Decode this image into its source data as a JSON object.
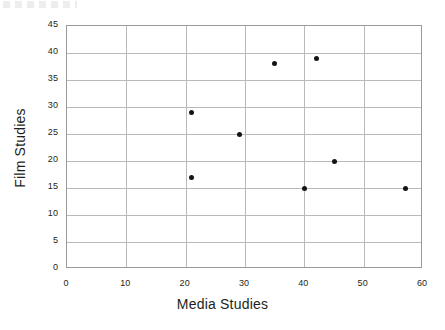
{
  "chart_data": {
    "type": "scatter",
    "title": "",
    "xlabel": "Media Studies",
    "ylabel": "Film Studies",
    "xlim": [
      0,
      60
    ],
    "ylim": [
      0,
      45
    ],
    "xticks": [
      0,
      10,
      20,
      30,
      40,
      50,
      60
    ],
    "yticks": [
      0,
      5,
      10,
      15,
      20,
      25,
      30,
      35,
      40,
      45
    ],
    "grid": true,
    "legend": "none",
    "marker_color": "#141414",
    "grid_color": "#b9b9bd",
    "axis_color": "#9a9a9e",
    "points": [
      {
        "x": 21,
        "y": 29
      },
      {
        "x": 21,
        "y": 17
      },
      {
        "x": 29,
        "y": 25
      },
      {
        "x": 35,
        "y": 38
      },
      {
        "x": 42,
        "y": 39
      },
      {
        "x": 40,
        "y": 15
      },
      {
        "x": 45,
        "y": 20
      },
      {
        "x": 57,
        "y": 15
      }
    ]
  }
}
